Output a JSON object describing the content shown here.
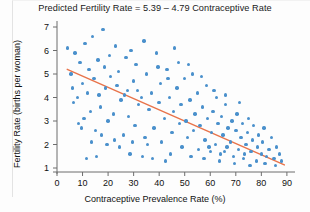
{
  "chart_data": {
    "type": "scatter",
    "title": "Predicted Fertility Rate = 5.39 – 4.79 Contraceptive Rate",
    "xlabel": "Contraceptive Prevalence Rate (%)",
    "ylabel": "Fertility Rate (births per woman)",
    "xlim": [
      0,
      92
    ],
    "ylim": [
      0.55,
      7.3
    ],
    "xticks": [
      0,
      10,
      20,
      30,
      40,
      50,
      60,
      70,
      80,
      90
    ],
    "yticks": [
      1,
      2,
      3,
      4,
      5,
      6,
      7
    ],
    "grid": false,
    "legend": null,
    "point_color": "#4a90cc",
    "line_color": "#e8734a",
    "axis_color": "#6d6d6d",
    "regression": {
      "intercept": 5.39,
      "slope_per_unit": -0.0479,
      "equation_label": "Predicted Fertility Rate = 5.39 – 4.79 Contraceptive Rate",
      "x_start": 4,
      "x_end": 89,
      "y_start": 5.2,
      "y_end": 1.13
    },
    "series": [
      {
        "name": "Countries",
        "points": [
          [
            4.0,
            6.1
          ],
          [
            5.5,
            5.0
          ],
          [
            6.0,
            4.4
          ],
          [
            6.5,
            3.8
          ],
          [
            7.0,
            5.9
          ],
          [
            8.0,
            4.0
          ],
          [
            8.5,
            2.9
          ],
          [
            9.0,
            5.5
          ],
          [
            10.0,
            4.6
          ],
          [
            10.5,
            3.1
          ],
          [
            11.0,
            6.3
          ],
          [
            12.0,
            4.2
          ],
          [
            12.5,
            5.2
          ],
          [
            13.0,
            3.4
          ],
          [
            14.0,
            6.6
          ],
          [
            14.5,
            4.8
          ],
          [
            15.0,
            2.6
          ],
          [
            16.0,
            5.6
          ],
          [
            16.5,
            4.1
          ],
          [
            17.0,
            3.6
          ],
          [
            18.0,
            6.9
          ],
          [
            18.5,
            5.3
          ],
          [
            19.0,
            4.4
          ],
          [
            20.0,
            3.0
          ],
          [
            20.5,
            5.8
          ],
          [
            21.0,
            4.9
          ],
          [
            22.0,
            3.3
          ],
          [
            23.0,
            6.2
          ],
          [
            23.5,
            4.5
          ],
          [
            24.0,
            5.1
          ],
          [
            25.0,
            3.9
          ],
          [
            26.0,
            2.4
          ],
          [
            27.0,
            5.7
          ],
          [
            27.5,
            4.3
          ],
          [
            28.0,
            3.2
          ],
          [
            29.0,
            6.0
          ],
          [
            30.0,
            4.7
          ],
          [
            30.5,
            2.8
          ],
          [
            31.0,
            5.4
          ],
          [
            32.0,
            3.7
          ],
          [
            33.0,
            4.0
          ],
          [
            34.0,
            6.4
          ],
          [
            34.5,
            2.3
          ],
          [
            35.0,
            5.0
          ],
          [
            36.0,
            3.5
          ],
          [
            37.0,
            4.2
          ],
          [
            38.0,
            2.7
          ],
          [
            39.0,
            5.9
          ],
          [
            40.0,
            3.8
          ],
          [
            40.5,
            4.6
          ],
          [
            41.0,
            2.1
          ],
          [
            42.0,
            3.1
          ],
          [
            43.0,
            5.2
          ],
          [
            44.0,
            4.0
          ],
          [
            45.0,
            2.5
          ],
          [
            45.5,
            3.4
          ],
          [
            46.0,
            6.1
          ],
          [
            47.0,
            4.4
          ],
          [
            48.0,
            2.9
          ],
          [
            48.5,
            3.7
          ],
          [
            49.0,
            1.9
          ],
          [
            50.0,
            4.8
          ],
          [
            50.5,
            3.0
          ],
          [
            51.0,
            2.3
          ],
          [
            52.0,
            3.9
          ],
          [
            53.0,
            5.0
          ],
          [
            53.5,
            2.6
          ],
          [
            54.0,
            3.3
          ],
          [
            55.0,
            4.2
          ],
          [
            55.5,
            1.8
          ],
          [
            56.0,
            2.8
          ],
          [
            57.0,
            3.6
          ],
          [
            58.0,
            2.2
          ],
          [
            58.5,
            4.5
          ],
          [
            59.0,
            3.1
          ],
          [
            60.0,
            1.7
          ],
          [
            60.5,
            2.5
          ],
          [
            61.0,
            3.4
          ],
          [
            62.0,
            2.0
          ],
          [
            62.5,
            4.0
          ],
          [
            63.0,
            2.9
          ],
          [
            64.0,
            1.6
          ],
          [
            64.5,
            3.2
          ],
          [
            65.0,
            2.4
          ],
          [
            66.0,
            3.7
          ],
          [
            66.5,
            1.9
          ],
          [
            67.0,
            2.7
          ],
          [
            68.0,
            2.1
          ],
          [
            68.5,
            3.0
          ],
          [
            69.0,
            1.5
          ],
          [
            70.0,
            2.6
          ],
          [
            70.5,
            3.3
          ],
          [
            71.0,
            1.8
          ],
          [
            72.0,
            2.3
          ],
          [
            72.5,
            2.9
          ],
          [
            73.0,
            1.4
          ],
          [
            74.0,
            2.0
          ],
          [
            74.5,
            2.5
          ],
          [
            75.0,
            3.1
          ],
          [
            76.0,
            1.7
          ],
          [
            76.5,
            2.2
          ],
          [
            77.0,
            2.8
          ],
          [
            78.0,
            1.3
          ],
          [
            78.5,
            1.9
          ],
          [
            79.0,
            2.4
          ],
          [
            80.0,
            1.6
          ],
          [
            80.5,
            2.1
          ],
          [
            81.0,
            2.7
          ],
          [
            82.0,
            1.5
          ],
          [
            83.0,
            1.8
          ],
          [
            84.0,
            2.3
          ],
          [
            85.0,
            1.4
          ],
          [
            86.0,
            1.9
          ],
          [
            87.0,
            1.6
          ],
          [
            88.0,
            1.3
          ],
          [
            24.5,
            1.9
          ],
          [
            28.5,
            1.6
          ],
          [
            33.5,
            1.5
          ],
          [
            37.5,
            1.4
          ],
          [
            42.5,
            1.3
          ],
          [
            19.5,
            2.0
          ],
          [
            15.5,
            1.5
          ],
          [
            11.5,
            1.4
          ],
          [
            35.5,
            2.0
          ],
          [
            44.5,
            1.6
          ],
          [
            51.5,
            5.4
          ],
          [
            56.5,
            4.9
          ],
          [
            61.5,
            4.3
          ],
          [
            66.0,
            4.1
          ],
          [
            71.5,
            3.8
          ],
          [
            47.5,
            5.5
          ],
          [
            43.5,
            4.8
          ],
          [
            39.5,
            5.3
          ],
          [
            31.5,
            4.3
          ],
          [
            26.5,
            4.1
          ],
          [
            52.5,
            1.5
          ],
          [
            57.5,
            1.4
          ],
          [
            63.5,
            1.3
          ],
          [
            69.5,
            1.2
          ],
          [
            75.5,
            1.1
          ],
          [
            81.5,
            1.2
          ],
          [
            85.5,
            1.1
          ],
          [
            59.5,
            1.9
          ],
          [
            65.5,
            1.7
          ],
          [
            73.5,
            1.6
          ],
          [
            22.5,
            2.2
          ],
          [
            17.5,
            2.4
          ],
          [
            13.5,
            2.1
          ],
          [
            9.5,
            2.7
          ],
          [
            29.5,
            2.1
          ]
        ]
      }
    ]
  }
}
